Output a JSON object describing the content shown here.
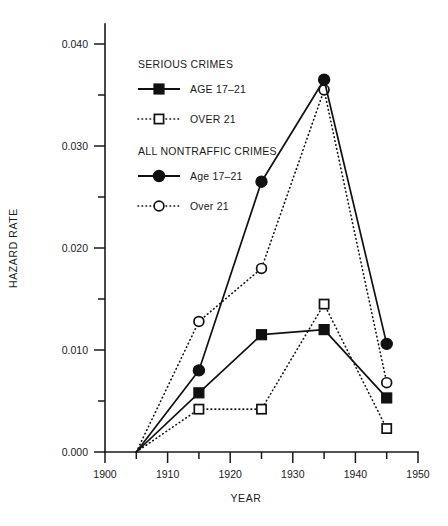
{
  "chart_data": {
    "type": "line",
    "title": "",
    "xlabel": "YEAR",
    "ylabel": "HAZARD RATE",
    "xlim": [
      1900,
      1950
    ],
    "ylim": [
      0.0,
      0.04
    ],
    "grid": false,
    "legend_position": "upper-left-inside",
    "x_ticks": [
      1900,
      1910,
      1920,
      1930,
      1940,
      1950
    ],
    "x_tick_labels": [
      "1900",
      "1910",
      "1920",
      "1930",
      "1940",
      "1950"
    ],
    "x_minor_ticks": [
      1905,
      1915,
      1925,
      1935,
      1945
    ],
    "y_ticks": [
      0.0,
      0.01,
      0.02,
      0.03,
      0.04
    ],
    "y_tick_labels": [
      "0.000",
      "0.010",
      "0.020",
      "0.030",
      "0.040"
    ],
    "y_minor_ticks": [
      0.005,
      0.015,
      0.025,
      0.035
    ],
    "legend_groups": [
      {
        "heading": "SERIOUS CRIMES",
        "entries": [
          {
            "label": "AGE 17–21",
            "marker": "filled-square",
            "line": "solid"
          },
          {
            "label": "OVER 21",
            "marker": "open-square",
            "line": "dotted"
          }
        ]
      },
      {
        "heading": "ALL NONTRAFFIC CRIMES",
        "entries": [
          {
            "label": "Age 17–21",
            "marker": "filled-circle",
            "line": "solid"
          },
          {
            "label": "Over 21",
            "marker": "open-circle",
            "line": "dotted"
          }
        ]
      }
    ],
    "series": [
      {
        "name": "SERIOUS CRIMES — AGE 17–21",
        "marker": "filled-square",
        "line": "solid",
        "x": [
          1905,
          1915,
          1925,
          1935,
          1945
        ],
        "values": [
          0.0,
          0.0058,
          0.0115,
          0.012,
          0.0053
        ]
      },
      {
        "name": "SERIOUS CRIMES — OVER 21",
        "marker": "open-square",
        "line": "dotted",
        "x": [
          1905,
          1915,
          1925,
          1935,
          1945
        ],
        "values": [
          0.0,
          0.0042,
          0.0042,
          0.0145,
          0.0023
        ]
      },
      {
        "name": "ALL NONTRAFFIC CRIMES — Age 17–21",
        "marker": "filled-circle",
        "line": "solid",
        "x": [
          1905,
          1915,
          1925,
          1935,
          1945
        ],
        "values": [
          0.0,
          0.008,
          0.0265,
          0.0365,
          0.0106
        ]
      },
      {
        "name": "ALL NONTRAFFIC CRIMES — Over 21",
        "marker": "open-circle",
        "line": "dotted",
        "x": [
          1905,
          1915,
          1925,
          1935,
          1945
        ],
        "values": [
          0.0,
          0.0128,
          0.018,
          0.0355,
          0.0068
        ]
      }
    ]
  }
}
